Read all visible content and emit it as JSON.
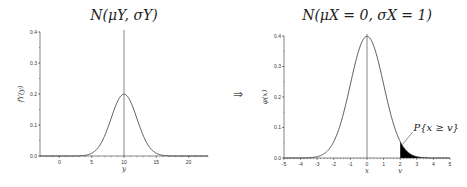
{
  "arrow": "⇒",
  "chart_data": [
    {
      "type": "line",
      "title": "N(μY, σY)",
      "xlabel": "y",
      "ylabel": "fY(y)",
      "mean": 10,
      "sd": 2,
      "xlim": [
        -3,
        23
      ],
      "ylim": [
        0,
        0.4
      ],
      "xticks": [
        0,
        5,
        10,
        15,
        20
      ],
      "yticks": [
        0.0,
        0.1,
        0.2,
        0.3,
        0.4
      ],
      "vertical_line_at": 10,
      "peak": 0.199
    },
    {
      "type": "area",
      "title": "N(μX = 0, σX = 1)",
      "xlabel": "x",
      "ylabel": "φ(x)",
      "mean": 0,
      "sd": 1,
      "xlim": [
        -5,
        5
      ],
      "ylim": [
        0,
        0.4
      ],
      "xticks": [
        -5,
        -4,
        -3,
        -2,
        -1,
        0,
        1,
        2,
        3,
        4,
        5
      ],
      "yticks": [
        0.0,
        0.1,
        0.2,
        0.3,
        0.4
      ],
      "vertical_line_at": 0,
      "shaded_from": 2,
      "v_label": "v",
      "annotation": "P{x ≥ v}",
      "peak": 0.399
    }
  ]
}
